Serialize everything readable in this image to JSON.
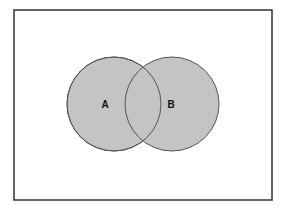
{
  "diagram": {
    "type": "venn",
    "frame": {
      "x": 14,
      "y": 10,
      "width": 258,
      "height": 190,
      "stroke": "#333333",
      "fill": "#ffffff"
    },
    "sets": [
      {
        "label": "A",
        "cx": 114,
        "cy": 104,
        "r": 47,
        "label_x": 105,
        "label_y": 108,
        "fill": "#c4c4c4",
        "stroke": "#555555"
      },
      {
        "label": "B",
        "cx": 172,
        "cy": 104,
        "r": 47,
        "label_x": 171,
        "label_y": 108,
        "fill": "#c4c4c4",
        "stroke": "#555555"
      }
    ],
    "intersection": {
      "label": ""
    }
  }
}
